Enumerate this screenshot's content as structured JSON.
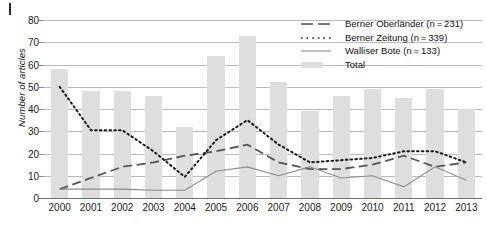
{
  "chart_data": {
    "type": "bar",
    "title": "",
    "xlabel": "",
    "ylabel": "Number of articles",
    "categories": [
      "2000",
      "2001",
      "2002",
      "2003",
      "2004",
      "2005",
      "2006",
      "2007",
      "2008",
      "2009",
      "2010",
      "2011",
      "2012",
      "2013"
    ],
    "ylim": [
      0,
      80
    ],
    "yticks": [
      0,
      10,
      20,
      30,
      40,
      50,
      60,
      70,
      80
    ],
    "grid": "horizontal",
    "legend_position": "top-right",
    "bar_series": {
      "name": "Total",
      "values": [
        58,
        48,
        48,
        46,
        32,
        64,
        73,
        52,
        39,
        46,
        49,
        45,
        49,
        40
      ],
      "color": "#dedede"
    },
    "series": [
      {
        "name": "Berner Oberländer (n = 231)",
        "style": "long-dash",
        "color": "#555555",
        "values": [
          4,
          9,
          14,
          16,
          19,
          21,
          24,
          16,
          13,
          13,
          15,
          19,
          14,
          16
        ]
      },
      {
        "name": "Berner Zeitung (n = 339)",
        "style": "dotted",
        "color": "#1a1a1a",
        "values": [
          50,
          30.5,
          30.5,
          21,
          9.5,
          26,
          35,
          24,
          16,
          17,
          18,
          21,
          21,
          16
        ]
      },
      {
        "name": "Walliser Bote (n = 133)",
        "style": "solid",
        "color": "#8a8a8a",
        "values": [
          4,
          4,
          4,
          3.5,
          3.5,
          12,
          14,
          10,
          14,
          9,
          10,
          5,
          14,
          8
        ]
      }
    ]
  },
  "legend": {
    "items": [
      {
        "label": "Berner Oberländer (n = 231)",
        "key": "long-dash-line-key"
      },
      {
        "label": "Berner Zeitung (n = 339)",
        "key": "dotted-line-key"
      },
      {
        "label": "Walliser Bote (n = 133)",
        "key": "solid-line-key"
      },
      {
        "label": "Total",
        "key": "bar-swatch-key"
      }
    ]
  },
  "axis": {
    "y_label": "Number of articles",
    "y_ticks": [
      "0",
      "10",
      "20",
      "30",
      "40",
      "50",
      "60",
      "70",
      "80"
    ],
    "x_ticks": [
      "2000",
      "2001",
      "2002",
      "2003",
      "2004",
      "2005",
      "2006",
      "2007",
      "2008",
      "2009",
      "2010",
      "2011",
      "2012",
      "2013"
    ]
  }
}
